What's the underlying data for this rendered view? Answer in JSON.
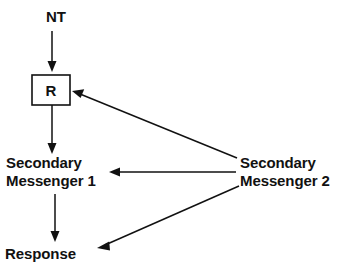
{
  "diagram": {
    "type": "flow-diagram",
    "background_color": "#ffffff",
    "stroke_color": "#111111",
    "nodes": {
      "neurotransmitter": {
        "label": "NT",
        "x": 46,
        "y": 22
      },
      "receptor": {
        "label": "R",
        "box_x": 32,
        "box_y": 75,
        "box_width": 38,
        "box_height": 30
      },
      "secondary_messenger_1": {
        "line1": "Secondary",
        "line2": "Messenger 1",
        "x": 6,
        "y1": 168,
        "y2": 186
      },
      "secondary_messenger_2": {
        "line1": "Secondary",
        "line2": "Messenger 2",
        "x": 240,
        "y1": 168,
        "y2": 186
      },
      "response": {
        "label": "Response",
        "x": 5,
        "y": 259
      }
    },
    "edges": [
      {
        "name": "nt-to-receptor",
        "from": "neurotransmitter",
        "to": "receptor",
        "kind": "vertical-arrow",
        "x1": 52,
        "y1": 31,
        "x2": 52,
        "y2": 71
      },
      {
        "name": "receptor-to-messenger-1",
        "from": "receptor",
        "to": "secondary_messenger_1",
        "kind": "vertical-arrow",
        "x1": 52,
        "y1": 105,
        "x2": 52,
        "y2": 153
      },
      {
        "name": "messenger-1-to-response",
        "from": "secondary_messenger_1",
        "to": "response",
        "kind": "vertical-arrow",
        "x1": 55,
        "y1": 194,
        "x2": 55,
        "y2": 241
      },
      {
        "name": "messenger-2-to-receptor",
        "from": "secondary_messenger_2",
        "to": "receptor",
        "kind": "diagonal-arrow",
        "x1": 237,
        "y1": 158,
        "x2": 73,
        "y2": 91
      },
      {
        "name": "messenger-2-to-messenger-1",
        "from": "secondary_messenger_2",
        "to": "secondary_messenger_1",
        "kind": "horizontal-arrow",
        "x1": 236,
        "y1": 172,
        "x2": 110,
        "y2": 172
      },
      {
        "name": "messenger-2-to-response",
        "from": "secondary_messenger_2",
        "to": "response",
        "kind": "diagonal-arrow",
        "x1": 239,
        "y1": 186,
        "x2": 98,
        "y2": 248
      }
    ]
  }
}
